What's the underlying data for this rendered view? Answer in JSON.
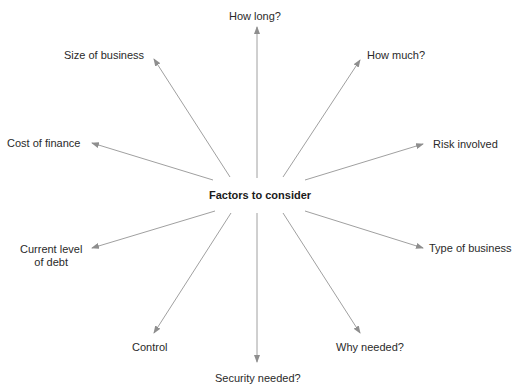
{
  "diagram": {
    "type": "mind-map",
    "center": "Factors to consider",
    "arrow_color": "#9a9a9a",
    "factors": [
      {
        "label": "How long?"
      },
      {
        "label": "How much?"
      },
      {
        "label": "Risk involved"
      },
      {
        "label": "Type of business"
      },
      {
        "label": "Why needed?"
      },
      {
        "label": "Security needed?"
      },
      {
        "label": "Control"
      },
      {
        "label": "Current level",
        "label2": "of debt"
      },
      {
        "label": "Cost of finance"
      },
      {
        "label": "Size of business"
      }
    ]
  }
}
